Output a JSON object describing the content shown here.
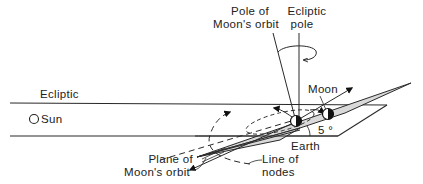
{
  "diagram": {
    "labels": {
      "pole_of_moons_orbit_line1": "Pole of",
      "pole_of_moons_orbit_line2": "Moon's orbit",
      "ecliptic_pole_line1": "Ecliptic",
      "ecliptic_pole_line2": "pole",
      "moon": "Moon",
      "ecliptic": "Ecliptic",
      "sun": "Sun",
      "angle": "5 °",
      "earth": "Earth",
      "plane_of_moons_orbit_line1": "Plane of",
      "plane_of_moons_orbit_line2": "Moon's orbit",
      "line_of_nodes_line1": "Line of",
      "line_of_nodes_line2": "nodes"
    },
    "colors": {
      "line": "#2a2a2a",
      "moon_plane_fill": "#d9d9d9",
      "background": "#ffffff"
    }
  }
}
